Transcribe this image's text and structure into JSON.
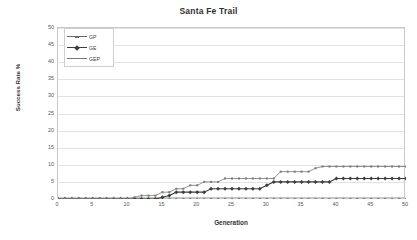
{
  "chart_data": {
    "type": "line",
    "title": "Santa Fe Trail",
    "xlabel": "Generation",
    "ylabel": "Success Rate %",
    "xlim": [
      0,
      50
    ],
    "ylim": [
      0,
      50
    ],
    "xticks": [
      0,
      5,
      10,
      15,
      20,
      25,
      30,
      35,
      40,
      45,
      50
    ],
    "yticks": [
      0,
      5,
      10,
      15,
      20,
      25,
      30,
      35,
      40,
      45,
      50
    ],
    "grid": "horizontal",
    "legend_position": "top-left-inside",
    "x": [
      0,
      1,
      2,
      3,
      4,
      5,
      6,
      7,
      8,
      9,
      10,
      11,
      12,
      13,
      14,
      15,
      16,
      17,
      18,
      19,
      20,
      21,
      22,
      23,
      24,
      25,
      26,
      27,
      28,
      29,
      30,
      31,
      32,
      33,
      34,
      35,
      36,
      37,
      38,
      39,
      40,
      41,
      42,
      43,
      44,
      45,
      46,
      47,
      48,
      49,
      50
    ],
    "series": [
      {
        "name": "GP",
        "color": "#6b6b6b",
        "marker": "small-dash",
        "values": [
          0,
          0,
          0,
          0,
          0,
          0,
          0,
          0,
          0,
          0,
          0,
          0,
          0,
          0,
          0,
          0,
          0,
          0,
          0,
          0,
          0,
          0,
          0,
          0,
          0,
          0,
          0,
          0,
          0,
          0,
          0,
          0,
          0,
          0,
          0,
          0,
          0,
          0,
          0,
          0,
          0,
          0,
          0,
          0,
          0,
          0,
          0,
          0,
          0,
          0,
          0
        ]
      },
      {
        "name": "GE",
        "color": "#3d3d3d",
        "marker": "diamond",
        "values": [
          0,
          0,
          0,
          0,
          0,
          0,
          0,
          0,
          0,
          0,
          0,
          0,
          0,
          0,
          0,
          0.5,
          1,
          2,
          2,
          2,
          2,
          2,
          3,
          3,
          3,
          3,
          3,
          3,
          3,
          3,
          4,
          5,
          5,
          5,
          5,
          5,
          5,
          5,
          5,
          5,
          6,
          6,
          6,
          6,
          6,
          6,
          6,
          6,
          6,
          6,
          6
        ]
      },
      {
        "name": "GEP",
        "color": "#777777",
        "marker": "line",
        "values": [
          0,
          0,
          0,
          0,
          0,
          0,
          0,
          0,
          0,
          0,
          0,
          0.5,
          1,
          1,
          1,
          2,
          2,
          3,
          3,
          4,
          4,
          5,
          5,
          5,
          6,
          6,
          6,
          6,
          6,
          6,
          6,
          6,
          8,
          8,
          8,
          8,
          8,
          9,
          9.5,
          9.5,
          9.5,
          9.5,
          9.5,
          9.5,
          9.5,
          9.5,
          9.5,
          9.5,
          9.5,
          9.5,
          9.5
        ]
      }
    ]
  }
}
